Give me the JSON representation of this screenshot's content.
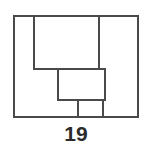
{
  "figure": {
    "label": "19",
    "caption_position": "bottom-center",
    "background_color": "#ffffff",
    "line_color": "#4a4a4a",
    "label_color": "#2b2b2b",
    "line_width": 1.4,
    "type": "technical-line-drawing",
    "shapes": [
      {
        "name": "outer-frame",
        "kind": "rectangle",
        "x": 14,
        "y": 16,
        "width": 124,
        "height": 101
      },
      {
        "name": "upper-left-vertical-edge",
        "kind": "line",
        "x1": 34,
        "y1": 16,
        "x2": 34,
        "y2": 69
      },
      {
        "name": "upper-right-vertical-edge",
        "kind": "line",
        "x1": 99,
        "y1": 16,
        "x2": 99,
        "y2": 69
      },
      {
        "name": "upper-shelf-horizontal-edge",
        "kind": "line",
        "x1": 34,
        "y1": 69,
        "x2": 105,
        "y2": 69
      },
      {
        "name": "center-block",
        "kind": "rectangle",
        "x": 58,
        "y": 69,
        "width": 47,
        "height": 31
      },
      {
        "name": "lower-left-drop-edge",
        "kind": "line",
        "x1": 78,
        "y1": 100,
        "x2": 78,
        "y2": 117
      },
      {
        "name": "lower-right-drop-edge",
        "kind": "line",
        "x1": 103,
        "y1": 100,
        "x2": 103,
        "y2": 117
      }
    ]
  }
}
